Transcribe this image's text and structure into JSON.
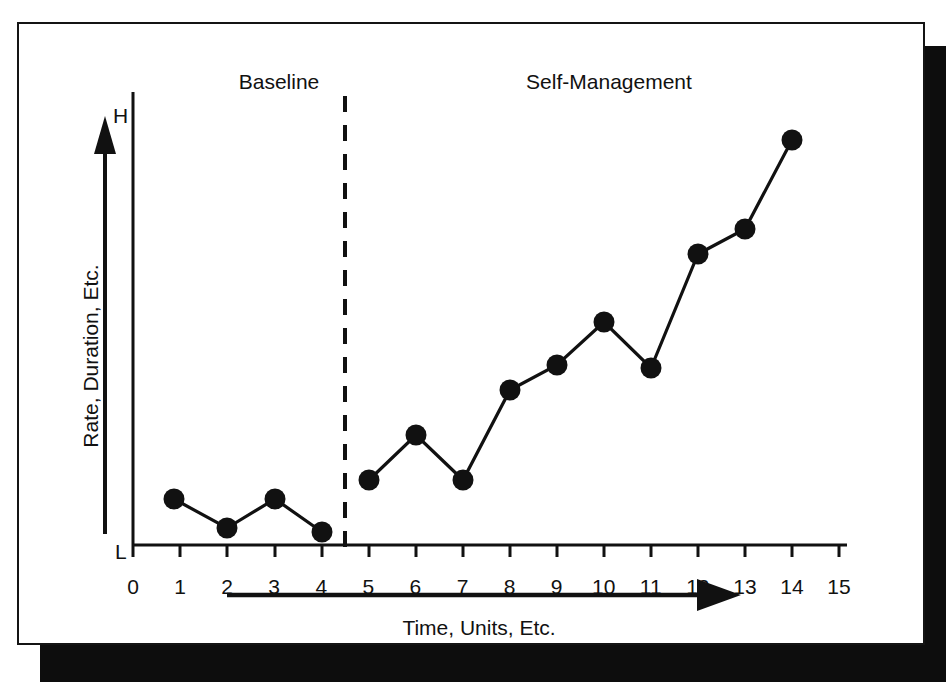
{
  "figure": {
    "phase_labels": {
      "baseline": "Baseline",
      "treatment": "Self-Management"
    },
    "y_axis": {
      "title": "Rate, Duration, Etc.",
      "high_marker": "H",
      "low_marker": "L"
    },
    "x_axis": {
      "title": "Time, Units, Etc."
    },
    "colors": {
      "ink": "#111111",
      "plate": "#ffffff",
      "shadow": "#0d0d0d"
    }
  },
  "chart_data": {
    "type": "line",
    "title": "",
    "subtitle": "",
    "xlabel": "Time, Units, Etc.",
    "ylabel": "Rate, Duration, Etc.",
    "xlim": [
      0,
      15
    ],
    "ylim": [
      0,
      100
    ],
    "grid": false,
    "legend": null,
    "x_tick_labels": [
      "0",
      "1",
      "2",
      "3",
      "4",
      "5",
      "6",
      "7",
      "8",
      "9",
      "10",
      "11",
      "12",
      "13",
      "14",
      "15"
    ],
    "x_ticks": [
      0,
      1,
      2,
      3,
      4,
      5,
      6,
      7,
      8,
      9,
      10,
      11,
      12,
      13,
      14,
      15
    ],
    "y_tick_labels": [
      "L",
      "H"
    ],
    "y_ticks": [
      0,
      100
    ],
    "marker": "filled-circle",
    "annotations": [
      {
        "name": "phase-label-baseline",
        "text": "Baseline",
        "x": 2.0,
        "position": "top"
      },
      {
        "name": "phase-label-treatment",
        "text": "Self-Management",
        "x": 9.5,
        "position": "top"
      },
      {
        "name": "phase-change-line",
        "text": "",
        "x": 4.5,
        "style": "dashed-vertical"
      },
      {
        "name": "time-direction-arrow",
        "text": "",
        "style": "horizontal-arrow-right"
      }
    ],
    "phases": [
      {
        "name": "Baseline",
        "x_start": 0.0,
        "x_end": 4.5
      },
      {
        "name": "Self-Management",
        "x_start": 4.5,
        "x_end": 15.0
      }
    ],
    "series": [
      {
        "name": "Baseline",
        "x": [
          1,
          2,
          3,
          4
        ],
        "values": [
          11,
          5,
          11,
          4
        ]
      },
      {
        "name": "Self-Management",
        "x": [
          5,
          6,
          7,
          8,
          9,
          10,
          11,
          12,
          13,
          14
        ],
        "values": [
          16,
          26,
          16,
          36,
          42,
          51,
          41,
          66,
          71,
          92
        ]
      }
    ]
  }
}
